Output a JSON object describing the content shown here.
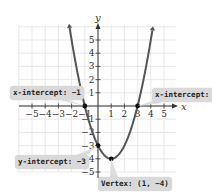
{
  "chart_data": {
    "type": "line",
    "title": "",
    "function": "y = x^2 - 2x - 3",
    "xlabel": "x",
    "ylabel": "y",
    "xlim": [
      -6,
      6
    ],
    "ylim": [
      -5.5,
      6
    ],
    "grid": true,
    "x_ticks": [
      "-5",
      "-4",
      "-3",
      "-2",
      "-1",
      "1",
      "2",
      "3",
      "4",
      "5"
    ],
    "y_ticks": [
      "5",
      "4",
      "3",
      "2",
      "1",
      "-1",
      "-2",
      "-3",
      "-4",
      "-5"
    ],
    "series": [
      {
        "name": "parabola",
        "color": "#555555",
        "x": [
          -2,
          -1,
          0,
          1,
          2,
          3,
          4
        ],
        "y": [
          5,
          0,
          -3,
          -4,
          -3,
          0,
          5
        ]
      }
    ],
    "points": [
      {
        "x": -1,
        "y": 0,
        "label": "x-intercept: −1"
      },
      {
        "x": 3,
        "y": 0,
        "label": "x-intercept: 3"
      },
      {
        "x": 0,
        "y": -3,
        "label": "y-intercept: −3"
      },
      {
        "x": 1,
        "y": -4,
        "label": "Vertex: (1, −4)"
      }
    ]
  },
  "annotations": {
    "x_intercept_left": "x-intercept: −1",
    "x_intercept_right": "x-intercept: 3",
    "y_intercept": "y-intercept: −3",
    "vertex": "Vertex: (1, −4)"
  },
  "axis": {
    "x_label": "x",
    "y_label": "y"
  },
  "colors": {
    "curve": "#555555",
    "grid": "#e3e3e3",
    "axis": "#333333",
    "label_bg": "#d9d9d9"
  }
}
